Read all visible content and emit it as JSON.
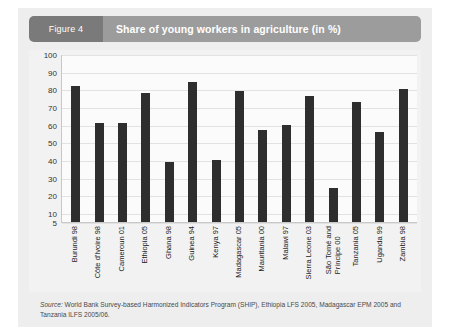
{
  "figure": {
    "badge": "Figure 4",
    "title": "Share of young workers in agriculture (in %)"
  },
  "source": {
    "label": "Source:",
    "text": " World Bank Survey-based Harmonized Indicators Program (SHIP), Ethiopia LFS 2005, Madagascar EPM 2005 and Tanzania ILFS 2005/06."
  },
  "colors": {
    "bar": "#2e2e2e",
    "panel": "#eeeeee",
    "header_badge": "#7a7a7a",
    "header_bar": "#9c9c9c",
    "plot_background": "#fbfbfb",
    "gridline": "#e2e2e2"
  },
  "chart_data": {
    "type": "bar",
    "title": "Share of young workers in agriculture (in %)",
    "xlabel": "",
    "ylabel": "",
    "ylim": [
      5,
      100
    ],
    "grid": true,
    "legend": false,
    "yticks": [
      100,
      90,
      80,
      70,
      60,
      50,
      40,
      30,
      20,
      10,
      5
    ],
    "categories": [
      "Burundi 98",
      "Côte d'Ivoire 98",
      "Cameroun 01",
      "Ethiopia 05",
      "Ghana 98",
      "Guinea 94",
      "Kenya 97",
      "Madagascar 05",
      "Mauritania 00",
      "Malawi 97",
      "Sierra Leone 03",
      "São Tomé and\nPríncipe 00",
      "Tanzania 05",
      "Uganda 99",
      "Zambia 98"
    ],
    "values": [
      82,
      61,
      61,
      78,
      39,
      84,
      40,
      79,
      57,
      60,
      76,
      24,
      73,
      56,
      80
    ]
  }
}
